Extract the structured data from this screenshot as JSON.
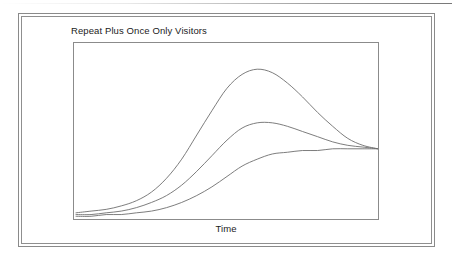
{
  "page": {
    "background_color": "#ffffff",
    "top_rule": "top-hairline"
  },
  "frame": {
    "style": "double-border",
    "border_color": "#8a8a8a"
  },
  "chart_data": {
    "type": "line",
    "title": "Repeat Plus Once Only Visitors",
    "xlabel": "Time",
    "ylabel": "",
    "grid": false,
    "legend": false,
    "legend_position": "none",
    "axis_ticks": false,
    "tick_labels": [],
    "xlim": [
      0,
      100
    ],
    "ylim": [
      0,
      100
    ],
    "line_color": "#6e6e6e",
    "line_width": 0.9,
    "series": [
      {
        "name": "repeat-plus-once-only-visitors-total",
        "description": "tall peaked curve",
        "x": [
          0,
          5,
          10,
          15,
          20,
          25,
          30,
          35,
          40,
          45,
          50,
          55,
          60,
          65,
          70,
          75,
          80,
          85,
          90,
          95,
          100
        ],
        "values": [
          3,
          4,
          5,
          7,
          10,
          15,
          23,
          34,
          48,
          62,
          75,
          83,
          86,
          84,
          78,
          70,
          61,
          53,
          46,
          42,
          40
        ]
      },
      {
        "name": "repeat-visitors",
        "description": "medium peaked curve",
        "x": [
          0,
          5,
          10,
          15,
          20,
          25,
          30,
          35,
          40,
          45,
          50,
          55,
          60,
          65,
          70,
          75,
          80,
          85,
          90,
          95,
          100
        ],
        "values": [
          2,
          2,
          3,
          4,
          6,
          9,
          13,
          19,
          27,
          36,
          45,
          52,
          55,
          55,
          53,
          50,
          47,
          44,
          42,
          41,
          40
        ]
      },
      {
        "name": "once-only-visitors",
        "description": "flat saturating s-curve",
        "x": [
          0,
          5,
          10,
          15,
          20,
          25,
          30,
          35,
          40,
          45,
          50,
          55,
          60,
          65,
          70,
          75,
          80,
          85,
          90,
          95,
          100
        ],
        "values": [
          1,
          1,
          2,
          2,
          3,
          4,
          6,
          9,
          13,
          18,
          24,
          30,
          34,
          37,
          38,
          39,
          39,
          40,
          40,
          40,
          40
        ]
      }
    ],
    "annotations": []
  }
}
